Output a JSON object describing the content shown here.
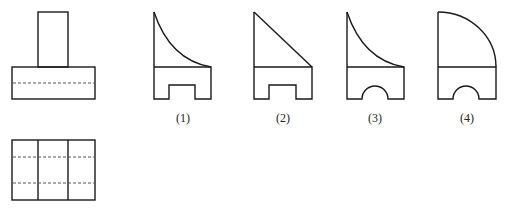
{
  "figure": {
    "front_view": {
      "name": "given-front-view"
    },
    "top_view": {
      "name": "given-top-view"
    },
    "options": [
      {
        "label": "(1)",
        "x": 183
      },
      {
        "label": "(2)",
        "x": 283
      },
      {
        "label": "(3)",
        "x": 375
      },
      {
        "label": "(4)",
        "x": 467
      }
    ]
  },
  "colors": {
    "line": "#1a1a1a",
    "hidden": "#555555",
    "background": "#ffffff"
  }
}
